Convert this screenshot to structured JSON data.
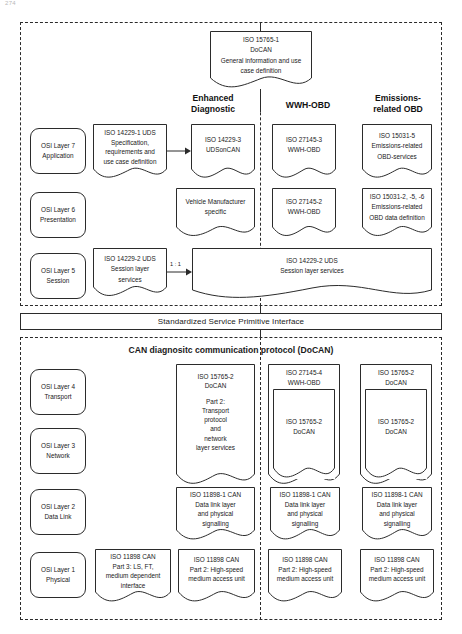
{
  "page": {
    "number": "274"
  },
  "diagram": {
    "title_top_box": {
      "lines": [
        "ISO 15765-1",
        "DoCAN",
        "General information and use",
        "case definition"
      ]
    },
    "column_titles": [
      {
        "name": "enhanced-diagnostic",
        "lines": [
          "Enhanced",
          "Diagnostic"
        ]
      },
      {
        "name": "wwh-obd",
        "lines": [
          "WWH-OBD"
        ]
      },
      {
        "name": "emissions-related-obd",
        "lines": [
          "Emissions-",
          "related OBD"
        ]
      }
    ],
    "upper_section": {
      "osi_layers": [
        {
          "lines": [
            "OSI Layer 7",
            "Application"
          ]
        },
        {
          "lines": [
            "OSI Layer 6",
            "Presentation"
          ]
        },
        {
          "lines": [
            "OSI Layer 5",
            "Session"
          ]
        }
      ],
      "layer7": {
        "spec_box": {
          "lines": [
            "ISO 14229-1 UDS",
            "Specification,",
            "requirements and",
            "use case definition"
          ]
        },
        "enhanced": {
          "lines": [
            "ISO 14229-3",
            "UDSonCAN"
          ]
        },
        "wwh": {
          "lines": [
            "ISO 27145-3",
            "WWH-OBD"
          ]
        },
        "emissions": {
          "lines": [
            "ISO 15031-5",
            "Emissions-related",
            "OBD-services"
          ]
        }
      },
      "layer6": {
        "enhanced": {
          "lines": [
            "Vehicle Manufacturer",
            "specific"
          ]
        },
        "wwh": {
          "lines": [
            "ISO 27145-2",
            "WWH-OBD"
          ]
        },
        "emissions": {
          "lines": [
            "ISO 15031-2, -5, -6",
            "Emissions-related",
            "OBD data definition"
          ]
        }
      },
      "layer5": {
        "spec_box": {
          "lines": [
            "ISO 14229-2 UDS",
            "Session layer",
            "services"
          ]
        },
        "ratio": "1 : 1",
        "wide_box": {
          "lines": [
            "ISO 14229-2 UDS",
            "Session layer services"
          ]
        }
      }
    },
    "interface_bar": {
      "label": "Standardized Service Primitive Interface"
    },
    "lower_section": {
      "title": "CAN diagnositc communication protocol (DoCAN)",
      "osi_layers": [
        {
          "lines": [
            "OSI Layer 4",
            "Transport"
          ]
        },
        {
          "lines": [
            "OSI Layer 3",
            "Network"
          ]
        },
        {
          "lines": [
            "OSI Layer 2",
            "Data Link"
          ]
        },
        {
          "lines": [
            "OSI Layer 1",
            "Physical"
          ]
        }
      ],
      "transport": {
        "enhanced": {
          "lines": [
            "ISO 15765-2",
            "DoCAN",
            "",
            "Part 2:",
            "Transport",
            "protocol",
            "and",
            "network",
            "layer services"
          ]
        },
        "wwh": {
          "header": [
            "ISO 27145-4",
            "WWH-OBD"
          ],
          "inner": [
            "ISO 15765-2",
            "DoCAN"
          ]
        },
        "emissions": {
          "header": [
            "ISO 15765-2",
            "DoCAN"
          ],
          "inner": [
            "ISO 15765-2",
            "DoCAN"
          ]
        }
      },
      "datalink": {
        "enhanced": {
          "lines": [
            "ISO 11898-1 CAN",
            "Data link layer",
            "and physical",
            "signalling"
          ]
        },
        "wwh": {
          "lines": [
            "ISO 11898-1 CAN",
            "Data link layer",
            "and physical",
            "signalling"
          ]
        },
        "emissions": {
          "lines": [
            "ISO 11898-1 CAN",
            "Data link layer",
            "and physical",
            "signalling"
          ]
        }
      },
      "physical": {
        "lowspeed": {
          "lines": [
            "ISO 11898 CAN",
            "Part 3: LS, FT,",
            "medium dependent",
            "interface"
          ]
        },
        "enhanced": {
          "lines": [
            "ISO 11898 CAN",
            "Part 2: High-speed",
            "medium access unit"
          ]
        },
        "wwh": {
          "lines": [
            "ISO 11898 CAN",
            "Part 2: High-speed",
            "medium access unit"
          ]
        },
        "emissions": {
          "lines": [
            "ISO 11898 CAN",
            "Part 2: High-speed",
            "medium access unit"
          ]
        }
      }
    },
    "colors": {
      "stroke": "#2b2b2b",
      "background": "#ffffff",
      "text": "#1a1a1a"
    }
  }
}
